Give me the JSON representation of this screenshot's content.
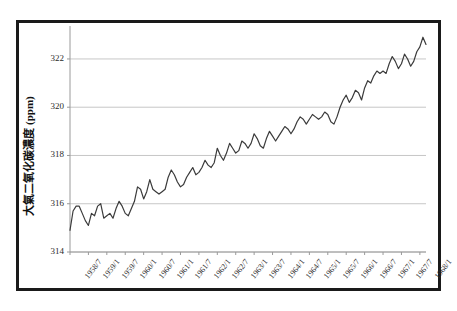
{
  "figure": {
    "background_color": "#ffffff",
    "frame_color": "#1a1a1a",
    "line_color": "#3b3b3b",
    "grid_color": "#b9b9b9",
    "axis_color": "#9a9a9a"
  },
  "chart_data": {
    "type": "line",
    "title": "",
    "xlabel": "",
    "ylabel": "大氣二氧化碳濃度 (ppm)",
    "ylim": [
      314,
      323.2
    ],
    "yticks": [
      314,
      316,
      318,
      320,
      322
    ],
    "ytick_labels": [
      "314",
      "316",
      "318",
      "320",
      "322"
    ],
    "grid": true,
    "grid_axis": "y",
    "legend": false,
    "legend_position": "none",
    "xlabel_rotation": -52,
    "xtick_labels": [
      "1958/7",
      "1959/1",
      "1959/7",
      "1960/1",
      "1960/7",
      "1961/1",
      "1961/7",
      "1962/1",
      "1962/7",
      "1963/1",
      "1963/7",
      "1964/1",
      "1964/7",
      "1965/1",
      "1965/7",
      "1966/1",
      "1966/7",
      "1967/1",
      "1967/7",
      "1968/1"
    ],
    "xtick_indices": [
      0,
      6,
      12,
      18,
      24,
      30,
      36,
      42,
      48,
      54,
      60,
      66,
      72,
      78,
      84,
      90,
      96,
      102,
      108,
      114
    ],
    "x_start": "1958/7",
    "x_end": "1968/1",
    "x_step_months": 1,
    "n_points": 115,
    "series": [
      {
        "name": "大氣二氧化碳濃度",
        "values": [
          314.9,
          315.7,
          315.9,
          315.9,
          315.6,
          315.3,
          315.1,
          315.6,
          315.5,
          315.9,
          316.0,
          315.4,
          315.5,
          315.6,
          315.4,
          315.8,
          316.1,
          315.9,
          315.6,
          315.5,
          315.8,
          316.1,
          316.7,
          316.6,
          316.2,
          316.5,
          317.0,
          316.6,
          316.5,
          316.4,
          316.5,
          316.6,
          317.1,
          317.4,
          317.2,
          316.9,
          316.7,
          316.8,
          317.1,
          317.3,
          317.5,
          317.2,
          317.3,
          317.5,
          317.8,
          317.6,
          317.5,
          317.7,
          318.3,
          318.0,
          317.8,
          318.1,
          318.5,
          318.3,
          318.1,
          318.2,
          318.6,
          318.5,
          318.3,
          318.5,
          318.9,
          318.7,
          318.4,
          318.3,
          318.7,
          319.0,
          318.8,
          318.6,
          318.8,
          319.0,
          319.2,
          319.1,
          318.9,
          319.1,
          319.4,
          319.6,
          319.5,
          319.3,
          319.5,
          319.7,
          319.6,
          319.5,
          319.6,
          319.8,
          319.7,
          319.4,
          319.3,
          319.6,
          320.0,
          320.3,
          320.5,
          320.2,
          320.4,
          320.7,
          320.6,
          320.3,
          320.8,
          321.1,
          321.0,
          321.3,
          321.5,
          321.4,
          321.5,
          321.4,
          321.8,
          322.1,
          321.9,
          321.6,
          321.8,
          322.2,
          322.0,
          321.7,
          321.9,
          322.3,
          322.5,
          322.9,
          322.6
        ]
      }
    ]
  }
}
